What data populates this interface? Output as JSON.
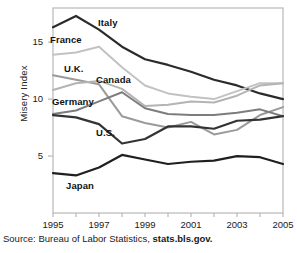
{
  "source": {
    "prefix": "Source: Bureau of Labor Statistics,",
    "url": "stats.bls.gov."
  },
  "chart_data": {
    "type": "line",
    "title": "",
    "xlabel": "",
    "ylabel": "Misery Index",
    "xlim": [
      1995,
      2005
    ],
    "ylim": [
      0,
      18
    ],
    "yticks": [
      5,
      10,
      15
    ],
    "xticks": [
      1995,
      1997,
      1999,
      2001,
      2003,
      2005
    ],
    "xtick_labels": [
      "1995",
      "1997",
      "1999",
      "2001",
      "2003",
      "2005"
    ],
    "ytick_labels": [
      "5",
      "10",
      "15"
    ],
    "grid": false,
    "legend": "inline-labels",
    "x": [
      1995,
      1996,
      1997,
      1998,
      1999,
      2000,
      2001,
      2002,
      2003,
      2004,
      2005
    ],
    "series": [
      {
        "name": "Italy",
        "color": "#2b2b2b",
        "width": 2.2,
        "label_x": 98,
        "label_y": 17,
        "values": [
          16.3,
          17.3,
          16.1,
          14.6,
          13.5,
          13.0,
          12.4,
          11.7,
          11.2,
          10.5,
          10.0
        ]
      },
      {
        "name": "France",
        "color": "#c2c2c2",
        "width": 2.0,
        "label_x": 50,
        "label_y": 34,
        "values": [
          13.9,
          14.1,
          14.6,
          12.8,
          11.2,
          10.5,
          10.2,
          10.0,
          10.7,
          11.4,
          11.4
        ]
      },
      {
        "name": "U.K.",
        "color": "#9a9a9a",
        "width": 2.0,
        "label_x": 64,
        "label_y": 63,
        "values": [
          12.1,
          11.7,
          11.3,
          8.5,
          7.9,
          7.5,
          8.0,
          6.9,
          7.3,
          8.6,
          9.3
        ]
      },
      {
        "name": "Canada",
        "color": "#b4b4b4",
        "width": 2.0,
        "label_x": 96,
        "label_y": 74,
        "values": [
          10.8,
          11.4,
          11.6,
          10.9,
          9.4,
          9.5,
          9.8,
          9.7,
          10.3,
          11.2,
          11.4
        ]
      },
      {
        "name": "Germany",
        "color": "#7d7d7d",
        "width": 2.0,
        "label_x": 52,
        "label_y": 96,
        "values": [
          8.7,
          9.0,
          9.8,
          10.6,
          9.2,
          8.7,
          8.6,
          8.6,
          8.8,
          9.1,
          8.5
        ]
      },
      {
        "name": "U.S.",
        "color": "#333333",
        "width": 2.2,
        "label_x": 96,
        "label_y": 127,
        "values": [
          8.6,
          8.4,
          7.8,
          6.1,
          6.5,
          7.6,
          7.6,
          7.4,
          8.1,
          8.2,
          8.5
        ]
      },
      {
        "name": "Japan",
        "color": "#1f1f1f",
        "width": 2.2,
        "label_x": 66,
        "label_y": 180,
        "values": [
          3.5,
          3.3,
          4.0,
          5.1,
          4.7,
          4.3,
          4.5,
          4.6,
          5.0,
          4.9,
          4.3
        ]
      }
    ]
  }
}
